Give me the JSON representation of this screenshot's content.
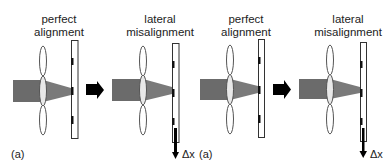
{
  "figure": {
    "colors": {
      "beam": "#6b6b6b",
      "cone": "#7a7a7a",
      "lens_stroke": "#555555",
      "plate_stroke": "#333333",
      "mark": "#111111",
      "arrow": "#000000"
    },
    "panels": [
      {
        "id": "p1",
        "title_line1": "perfect",
        "title_line2": "alignment",
        "mode": "perfect"
      },
      {
        "id": "p2",
        "title_line1": "lateral",
        "title_line2": "misalignment",
        "mode": "lateral",
        "shift_label": "Δx"
      },
      {
        "id": "p3",
        "title_line1": "perfect",
        "title_line2": "alignment",
        "mode": "perfect"
      },
      {
        "id": "p4",
        "title_line1": "lateral",
        "title_line2": "misalignment",
        "mode": "lateral",
        "shift_label": "Δx"
      }
    ],
    "subfigure_labels": [
      "(a)",
      "(a)"
    ]
  }
}
